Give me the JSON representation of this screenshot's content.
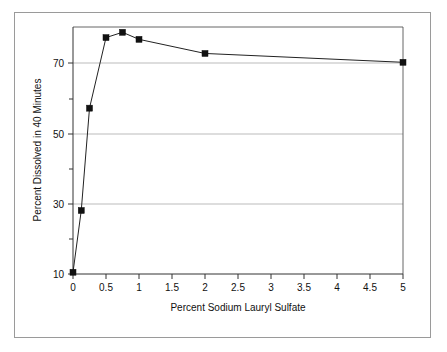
{
  "figure": {
    "background_color": "#ffffff",
    "frame_color": "#9a9a9a",
    "axis_color": "#333333",
    "grid_color": "#aaaaaa",
    "marker_color": "#111111"
  },
  "chart_data": {
    "type": "line",
    "title": "",
    "subtitle": "",
    "xlabel": "Percent Sodium Lauryl Sulfate",
    "ylabel": "Percent Dissolved in 40 Minutes",
    "xlim": [
      0,
      5
    ],
    "ylim": [
      10,
      80
    ],
    "xticks": [
      0,
      0.5,
      1,
      1.5,
      2,
      2.5,
      3,
      3.5,
      4,
      4.5,
      5
    ],
    "xtick_labels": [
      "0",
      "0.5",
      "1",
      "1.5",
      "2",
      "2.5",
      "3",
      "3.5",
      "4",
      "4.5",
      "5"
    ],
    "yticks": [
      10,
      30,
      50,
      70
    ],
    "ytick_labels": [
      "10",
      "30",
      "50",
      "70"
    ],
    "yticks_minor": [
      20,
      40,
      60
    ],
    "grid": "horizontal-major",
    "legend": "none",
    "marker": "square",
    "x": [
      0,
      0.125,
      0.25,
      0.5,
      0.75,
      1,
      2,
      5
    ],
    "y": [
      10.5,
      28,
      57,
      77,
      78.5,
      76.5,
      72.5,
      70
    ],
    "series": [
      {
        "name": "Percent Dissolved in 40 Minutes",
        "x": [
          0,
          0.125,
          0.25,
          0.5,
          0.75,
          1,
          2,
          5
        ],
        "values": [
          10.5,
          28,
          57,
          77,
          78.5,
          76.5,
          72.5,
          70
        ]
      }
    ],
    "annotations": []
  },
  "axes_geometry": {
    "plot_left_px": 73,
    "plot_right_px": 403,
    "plot_top_px": 27,
    "plot_bottom_px": 274
  }
}
